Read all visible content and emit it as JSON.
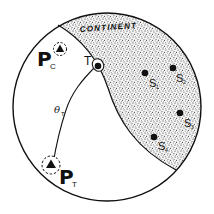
{
  "diagram": {
    "region_label": "CONTINENT",
    "colors": {
      "ink": "#111111",
      "background": "#ffffff",
      "stipple": "#2a2a2a"
    },
    "transmitter_point": {
      "label": "T"
    },
    "path_label": {
      "symbol": "θ",
      "subscript": "T"
    },
    "stations": [
      {
        "label": "P",
        "subscript": "C"
      },
      {
        "label": "P",
        "subscript": "T"
      }
    ],
    "sites": [
      {
        "label": "S",
        "subscript": "1"
      },
      {
        "label": "S",
        "subscript": "2"
      },
      {
        "label": "S",
        "subscript": "3"
      },
      {
        "label": "S",
        "subscript": "4"
      }
    ]
  }
}
